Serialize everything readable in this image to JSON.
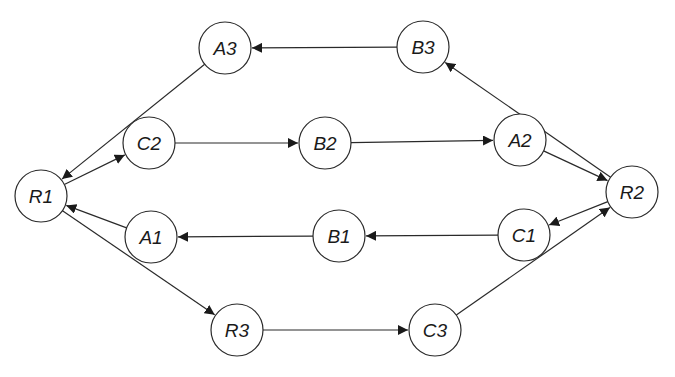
{
  "diagram": {
    "type": "directed-graph",
    "node_radius": 26,
    "colors": {
      "stroke": "#2a2a2a",
      "fill": "#ffffff",
      "text": "#1a1a1a",
      "background": "#ffffff"
    },
    "nodes": [
      {
        "id": "R1",
        "label": "R1",
        "x": 41,
        "y": 196
      },
      {
        "id": "A3",
        "label": "A3",
        "x": 225,
        "y": 48
      },
      {
        "id": "B3",
        "label": "B3",
        "x": 423,
        "y": 47
      },
      {
        "id": "C2",
        "label": "C2",
        "x": 149,
        "y": 143
      },
      {
        "id": "B2",
        "label": "B2",
        "x": 325,
        "y": 143
      },
      {
        "id": "A2",
        "label": "A2",
        "x": 520,
        "y": 140
      },
      {
        "id": "R2",
        "label": "R2",
        "x": 632,
        "y": 192
      },
      {
        "id": "A1",
        "label": "A1",
        "x": 151,
        "y": 237
      },
      {
        "id": "B1",
        "label": "B1",
        "x": 339,
        "y": 236
      },
      {
        "id": "C1",
        "label": "C1",
        "x": 524,
        "y": 235
      },
      {
        "id": "R3",
        "label": "R3",
        "x": 237,
        "y": 330
      },
      {
        "id": "C3",
        "label": "C3",
        "x": 435,
        "y": 330
      }
    ],
    "edges": [
      {
        "from": "B3",
        "to": "A3"
      },
      {
        "from": "A3",
        "to": "R1"
      },
      {
        "from": "R1",
        "to": "C2"
      },
      {
        "from": "C2",
        "to": "B2"
      },
      {
        "from": "B2",
        "to": "A2"
      },
      {
        "from": "A2",
        "to": "R2"
      },
      {
        "from": "R2",
        "to": "B3"
      },
      {
        "from": "R2",
        "to": "C1"
      },
      {
        "from": "C1",
        "to": "B1"
      },
      {
        "from": "B1",
        "to": "A1"
      },
      {
        "from": "A1",
        "to": "R1"
      },
      {
        "from": "R1",
        "to": "R3"
      },
      {
        "from": "R3",
        "to": "C3"
      },
      {
        "from": "C3",
        "to": "R2"
      }
    ]
  }
}
